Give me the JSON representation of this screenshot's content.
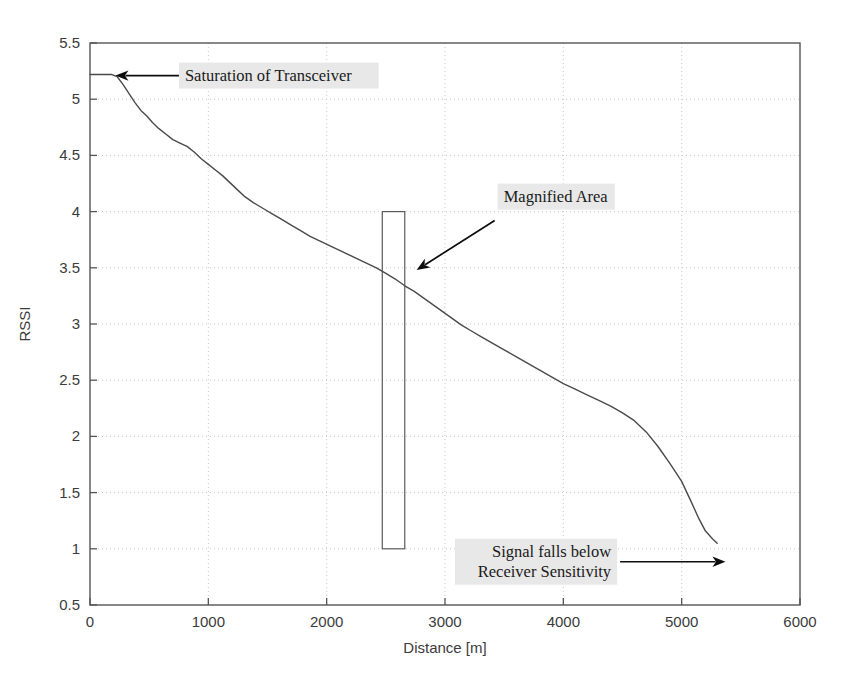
{
  "chart_data": {
    "type": "line",
    "title": "",
    "xlabel": "Distance [m]",
    "ylabel": "RSSI",
    "xlim": [
      0,
      6000
    ],
    "ylim": [
      0.5,
      5.5
    ],
    "xticks": [
      0,
      1000,
      2000,
      3000,
      4000,
      5000,
      6000
    ],
    "xtick_labels": [
      "0",
      "1000",
      "2000",
      "3000",
      "4000",
      "5000",
      "6000"
    ],
    "yticks": [
      0.5,
      1,
      1.5,
      2,
      2.5,
      3,
      3.5,
      4,
      4.5,
      5,
      5.5
    ],
    "ytick_labels": [
      "0.5",
      "1",
      "1.5",
      "2",
      "2.5",
      "3",
      "3.5",
      "4",
      "4.5",
      "5",
      "5.5"
    ],
    "grid": true,
    "legend": "none",
    "series": [
      {
        "name": "RSSI vs Distance",
        "color": "#4a4a4a",
        "x": [
          0,
          60,
          120,
          180,
          230,
          280,
          330,
          380,
          430,
          480,
          530,
          580,
          640,
          700,
          760,
          820,
          880,
          940,
          1000,
          1060,
          1120,
          1180,
          1240,
          1300,
          1380,
          1460,
          1540,
          1620,
          1700,
          1780,
          1860,
          1940,
          2020,
          2100,
          2180,
          2260,
          2340,
          2420,
          2500,
          2580,
          2660,
          2740,
          2820,
          2900,
          2980,
          3060,
          3140,
          3220,
          3300,
          3400,
          3500,
          3600,
          3700,
          3800,
          3900,
          4000,
          4100,
          4200,
          4300,
          4400,
          4500,
          4600,
          4700,
          4800,
          4900,
          5000,
          5080,
          5140,
          5200,
          5260,
          5300
        ],
        "y": [
          5.22,
          5.22,
          5.22,
          5.22,
          5.2,
          5.13,
          5.05,
          4.97,
          4.9,
          4.85,
          4.79,
          4.74,
          4.69,
          4.64,
          4.61,
          4.58,
          4.53,
          4.47,
          4.42,
          4.37,
          4.32,
          4.26,
          4.2,
          4.14,
          4.08,
          4.03,
          3.98,
          3.93,
          3.88,
          3.83,
          3.78,
          3.74,
          3.7,
          3.66,
          3.62,
          3.58,
          3.54,
          3.5,
          3.45,
          3.4,
          3.34,
          3.29,
          3.23,
          3.17,
          3.11,
          3.05,
          2.99,
          2.94,
          2.89,
          2.83,
          2.77,
          2.71,
          2.65,
          2.59,
          2.53,
          2.47,
          2.42,
          2.37,
          2.32,
          2.27,
          2.21,
          2.14,
          2.04,
          1.91,
          1.76,
          1.6,
          1.42,
          1.28,
          1.16,
          1.09,
          1.05
        ]
      }
    ],
    "annotations": [
      {
        "id": "saturation",
        "text": "Saturation of Transceiver",
        "lines": [
          "Saturation of Transceiver"
        ],
        "arrow_from": [
          760,
          5.21
        ],
        "arrow_to": [
          215,
          5.21
        ],
        "highlight": "#e8e8e8"
      },
      {
        "id": "magnified",
        "text": "Magnified Area",
        "lines": [
          "Magnified Area"
        ],
        "arrow_from": [
          3420,
          3.92
        ],
        "arrow_to": [
          2760,
          3.48
        ],
        "highlight": "#e8e8e8"
      },
      {
        "id": "sensitivity",
        "text": "Signal falls below Receiver Sensitivity",
        "lines": [
          "Signal falls below",
          "Receiver Sensitivity"
        ],
        "arrow_from": [
          4480,
          0.885
        ],
        "arrow_to": [
          5370,
          0.885
        ],
        "highlight": "#e8e8e8"
      }
    ],
    "shapes": [
      {
        "id": "magnified-area-box",
        "type": "rect",
        "x0": 2470,
        "x1": 2660,
        "y0": 1.0,
        "y1": 4.0,
        "stroke": "#5a5a5a",
        "fill": "none"
      }
    ]
  },
  "colors": {
    "background": "#ffffff",
    "curve": "#4a4a4a",
    "grid": "#c9c9c9",
    "axis": "#555555",
    "annotation_highlight": "#e8e8e8",
    "annotation_text": "#1a1a1a",
    "tick_text": "#3b3b3b"
  }
}
